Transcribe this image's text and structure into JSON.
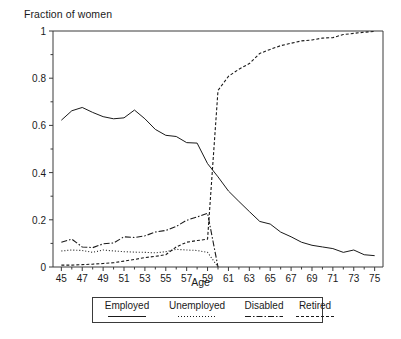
{
  "chart_data": {
    "type": "line",
    "title": "",
    "ylabel": "Fraction of women",
    "xlabel": "Age",
    "xlim": [
      44.2,
      75.8
    ],
    "ylim": [
      0,
      1
    ],
    "grid": false,
    "legend_position": "bottom",
    "ytick_labels": [
      "0",
      "0.2",
      "0.4",
      "0.6",
      "0.8",
      "1"
    ],
    "ytick_values": [
      0,
      0.2,
      0.4,
      0.6,
      0.8,
      1
    ],
    "xtick_labels": [
      "45",
      "47",
      "49",
      "51",
      "53",
      "55",
      "57",
      "59",
      "61",
      "63",
      "65",
      "67",
      "69",
      "71",
      "73",
      "75"
    ],
    "xtick_values": [
      45,
      47,
      49,
      51,
      53,
      55,
      57,
      59,
      61,
      63,
      65,
      67,
      69,
      71,
      73,
      75
    ],
    "x": [
      45,
      46,
      47,
      48,
      49,
      50,
      51,
      52,
      53,
      54,
      55,
      56,
      57,
      58,
      59,
      60,
      61,
      62,
      63,
      64,
      65,
      66,
      67,
      68,
      69,
      70,
      71,
      72,
      73,
      74,
      75
    ],
    "series": [
      {
        "name": "Employed",
        "style": "solid",
        "values": [
          0.622,
          0.662,
          0.676,
          0.655,
          0.637,
          0.628,
          0.632,
          0.665,
          0.628,
          0.583,
          0.558,
          0.553,
          0.527,
          0.525,
          0.438,
          0.382,
          0.322,
          0.278,
          0.235,
          0.193,
          0.182,
          0.148,
          0.128,
          0.105,
          0.092,
          0.085,
          0.078,
          0.062,
          0.072,
          0.052,
          0.048
        ]
      },
      {
        "name": "Unemployed",
        "style": "dotted",
        "values": [
          0.068,
          0.072,
          0.07,
          0.062,
          0.072,
          0.068,
          0.065,
          0.063,
          0.062,
          0.06,
          0.065,
          0.075,
          0.072,
          0.07,
          0.062,
          0.0,
          0.0,
          0.0,
          0.0,
          0.0,
          0.0,
          0.0,
          0.0,
          0.0,
          0.0,
          0.0,
          0.0,
          0.0,
          0.0,
          0.0,
          0.0
        ]
      },
      {
        "name": "Disabled",
        "style": "dashdot",
        "values": [
          0.105,
          0.118,
          0.085,
          0.082,
          0.098,
          0.102,
          0.128,
          0.125,
          0.132,
          0.148,
          0.155,
          0.172,
          0.198,
          0.212,
          0.228,
          0.0,
          0.0,
          0.0,
          0.0,
          0.0,
          0.0,
          0.0,
          0.0,
          0.0,
          0.0,
          0.0,
          0.0,
          0.0,
          0.0,
          0.0,
          0.0
        ]
      },
      {
        "name": "Retired",
        "style": "dashed",
        "values": [
          0.008,
          0.008,
          0.01,
          0.012,
          0.015,
          0.018,
          0.025,
          0.032,
          0.04,
          0.045,
          0.052,
          0.085,
          0.105,
          0.112,
          0.118,
          0.748,
          0.808,
          0.838,
          0.862,
          0.905,
          0.922,
          0.938,
          0.948,
          0.958,
          0.962,
          0.97,
          0.972,
          0.985,
          0.99,
          0.995,
          0.998
        ]
      }
    ]
  },
  "legend": {
    "items": [
      {
        "label": "Employed",
        "style": "solid"
      },
      {
        "label": "Unemployed",
        "style": "dotted"
      },
      {
        "label": "Disabled",
        "style": "dashdot"
      },
      {
        "label": "Retired",
        "style": "dashed"
      }
    ]
  },
  "colors": {
    "line": "#1a1a1a",
    "axis": "#3a3a3a",
    "background": "#ffffff"
  }
}
